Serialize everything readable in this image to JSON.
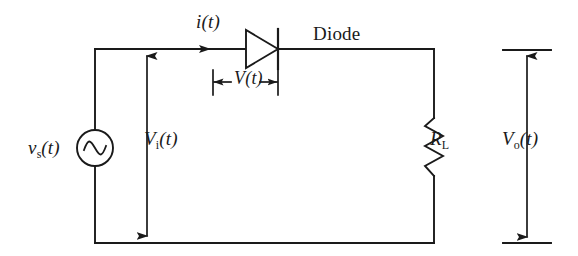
{
  "figure": {
    "type": "circuit-schematic",
    "background_color": "#ffffff",
    "line_color": "#1a1a1a"
  },
  "labels": {
    "source_voltage": {
      "symbol": "v",
      "subscript": "s",
      "arg": "(t)"
    },
    "input_voltage": {
      "symbol": "V",
      "subscript": "i",
      "arg": "(t)"
    },
    "current": {
      "symbol": "i",
      "subscript": "",
      "arg": "(t)"
    },
    "diode_voltage": {
      "symbol": "V",
      "subscript": "",
      "arg": "(t)"
    },
    "diode_name": "Diode",
    "load_resistor": {
      "symbol": "R",
      "subscript": "L",
      "arg": ""
    },
    "output_voltage": {
      "symbol": "V",
      "subscript": "o",
      "arg": "(t)"
    }
  },
  "components": {
    "ac_source": "ac-voltage-source",
    "diode": "diode",
    "resistor": "load-resistor"
  }
}
